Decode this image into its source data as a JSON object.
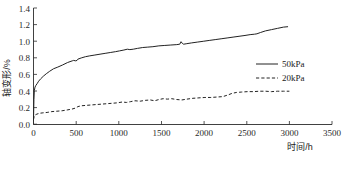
{
  "chart_data": {
    "type": "line",
    "title": "",
    "xlabel": "时间/h",
    "ylabel": "轴变形/%",
    "xlim": [
      0,
      3500
    ],
    "ylim": [
      0.0,
      1.4
    ],
    "xticks": [
      0,
      500,
      1000,
      1500,
      2000,
      2500,
      3000,
      3500
    ],
    "xtick_labels": [
      "0",
      "500",
      "1000",
      "1500",
      "2000",
      "2500",
      "3000",
      "3500"
    ],
    "yticks": [
      0.0,
      0.2,
      0.4,
      0.6,
      0.8,
      1.0,
      1.2,
      1.4
    ],
    "ytick_labels": [
      "0.0",
      "0.2",
      "0.4",
      "0.6",
      "0.8",
      "1.0",
      "1.2",
      "1.4"
    ],
    "grid": false,
    "legend_position": "right-middle",
    "series": [
      {
        "name": "50kPa",
        "style": "solid",
        "color": "#222222",
        "x": [
          0,
          5,
          10,
          18,
          28,
          42,
          60,
          85,
          115,
          150,
          190,
          235,
          285,
          340,
          400,
          455,
          470,
          495,
          510,
          520,
          560,
          610,
          660,
          720,
          780,
          840,
          900,
          960,
          1010,
          1060,
          1100,
          1130,
          1170,
          1220,
          1280,
          1340,
          1400,
          1470,
          1540,
          1610,
          1680,
          1715,
          1730,
          1745,
          1760,
          1790,
          1850,
          1920,
          1990,
          2060,
          2130,
          2200,
          2270,
          2340,
          2410,
          2480,
          2540,
          2590,
          2620,
          2660,
          2720,
          2790,
          2860,
          2930,
          2980
        ],
        "y": [
          0.05,
          0.3,
          0.41,
          0.45,
          0.47,
          0.49,
          0.52,
          0.55,
          0.58,
          0.61,
          0.64,
          0.67,
          0.69,
          0.715,
          0.745,
          0.765,
          0.77,
          0.765,
          0.77,
          0.785,
          0.8,
          0.815,
          0.825,
          0.835,
          0.845,
          0.855,
          0.865,
          0.875,
          0.885,
          0.895,
          0.905,
          0.9,
          0.905,
          0.915,
          0.925,
          0.93,
          0.935,
          0.945,
          0.95,
          0.955,
          0.96,
          0.965,
          0.995,
          0.975,
          0.965,
          0.97,
          0.98,
          0.99,
          1.0,
          1.01,
          1.02,
          1.03,
          1.04,
          1.05,
          1.06,
          1.07,
          1.08,
          1.085,
          1.09,
          1.105,
          1.125,
          1.14,
          1.155,
          1.17,
          1.175
        ]
      },
      {
        "name": "20kPa",
        "style": "dashed",
        "color": "#222222",
        "x": [
          0,
          8,
          20,
          40,
          70,
          110,
          160,
          215,
          275,
          335,
          395,
          450,
          500,
          520,
          560,
          620,
          680,
          740,
          800,
          860,
          920,
          980,
          1040,
          1090,
          1140,
          1190,
          1250,
          1310,
          1370,
          1420,
          1470,
          1520,
          1570,
          1620,
          1680,
          1740,
          1800,
          1870,
          1940,
          2010,
          2080,
          2150,
          2220,
          2280,
          2330,
          2380,
          2440,
          2510,
          2580,
          2650,
          2720,
          2790,
          2860,
          2930,
          3000
        ],
        "y": [
          0.06,
          0.1,
          0.115,
          0.125,
          0.135,
          0.14,
          0.145,
          0.155,
          0.16,
          0.165,
          0.175,
          0.185,
          0.2,
          0.215,
          0.225,
          0.23,
          0.235,
          0.24,
          0.245,
          0.25,
          0.255,
          0.26,
          0.27,
          0.265,
          0.275,
          0.285,
          0.28,
          0.29,
          0.295,
          0.285,
          0.3,
          0.31,
          0.305,
          0.31,
          0.3,
          0.295,
          0.305,
          0.315,
          0.32,
          0.325,
          0.325,
          0.33,
          0.335,
          0.355,
          0.375,
          0.385,
          0.39,
          0.395,
          0.395,
          0.4,
          0.4,
          0.395,
          0.4,
          0.4,
          0.4
        ]
      }
    ],
    "annotations": []
  },
  "legend": {
    "items": [
      {
        "label": "50kPa",
        "style": "solid"
      },
      {
        "label": "20kPa",
        "style": "dashed"
      }
    ]
  },
  "caption": {
    "text": ""
  }
}
